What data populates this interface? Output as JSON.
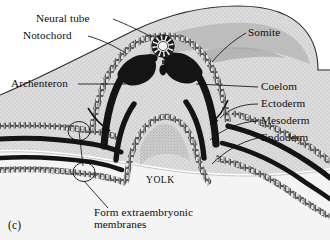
{
  "figure": {
    "panel_id": "(c)",
    "background_color": "#ffffff",
    "embryo_body_color": "#d9d9d9",
    "yolk_color": "#f2f2f2",
    "dark_tissue_color": "#141414",
    "cell_layer_fill": "#e8e8e8",
    "outline_color": "#111111"
  },
  "labels": {
    "neural_tube": "Neural tube",
    "notochord": "Notochord",
    "somite": "Somite",
    "archenteron": "Archenteron",
    "coelom": "Coelom",
    "ectoderm": "Ectoderm",
    "mesoderm": "Mesoderm",
    "endoderm": "Endoderm",
    "yolk": "Yolk",
    "extraembryonic_line1": "Form extraembryonic",
    "extraembryonic_line2": "membranes"
  },
  "structures": [
    {
      "name": "neural-tube",
      "description": "ring of dark cells with light lumen at dorsal midline"
    },
    {
      "name": "notochord",
      "description": "small dark oval beneath the neural tube"
    },
    {
      "name": "somite",
      "description": "paired dark blocks of mesoderm flanking the neural tube"
    },
    {
      "name": "archenteron",
      "description": "central cavity lined by endoderm cells"
    },
    {
      "name": "coelom",
      "description": "white space between mesoderm layers"
    },
    {
      "name": "ectoderm",
      "description": "outer stippled cell sheet"
    },
    {
      "name": "mesoderm",
      "description": "dark middle sheet"
    },
    {
      "name": "endoderm",
      "description": "inner stippled cell sheet"
    },
    {
      "name": "yolk",
      "description": "large pale region below the embryo"
    }
  ],
  "annotations": {
    "fold_arrows": 2,
    "membrane_circles": 2
  }
}
